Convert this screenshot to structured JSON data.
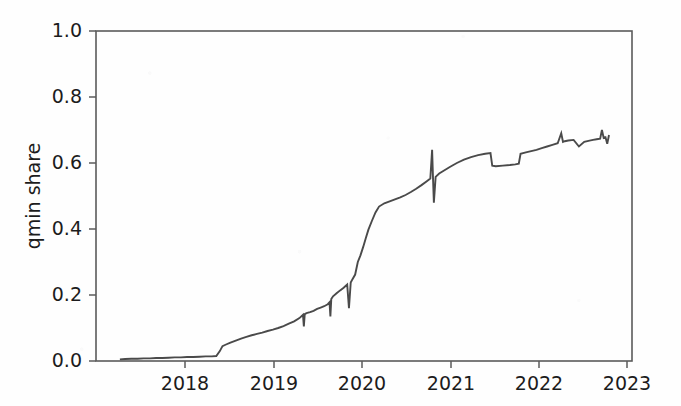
{
  "figure": {
    "background_color": "#fefefe",
    "line_color": "#4a4a4a",
    "axis_color": "#5b5b5b",
    "text_color": "#1c1c1c"
  },
  "axes": {
    "y_title": "qmin share",
    "x_title": "",
    "y_ticks": [
      "0.0",
      "0.2",
      "0.4",
      "0.6",
      "0.8",
      "1.0"
    ],
    "x_ticks": [
      "2018",
      "2019",
      "2020",
      "2021",
      "2022",
      "2023"
    ]
  },
  "chart_data": {
    "type": "line",
    "title": "",
    "xlabel": "",
    "ylabel": "qmin share",
    "xlim": [
      2017.0,
      2023.06
    ],
    "ylim": [
      0.0,
      1.0
    ],
    "grid": false,
    "legend": null,
    "x_tick_values": [
      2018,
      2019,
      2020,
      2021,
      2022,
      2023
    ],
    "x_tick_labels": [
      "2018",
      "2019",
      "2020",
      "2021",
      "2022",
      "2023"
    ],
    "y_tick_values": [
      0.0,
      0.2,
      0.4,
      0.6,
      0.8,
      1.0
    ],
    "y_tick_labels": [
      "0.0",
      "0.2",
      "0.4",
      "0.6",
      "0.8",
      "1.0"
    ],
    "series": [
      {
        "name": "qmin share",
        "color": "#4a4a4a",
        "x": [
          2017.27,
          2017.33,
          2017.4,
          2017.47,
          2017.54,
          2017.61,
          2017.68,
          2017.75,
          2017.82,
          2017.89,
          2017.96,
          2018.03,
          2018.1,
          2018.17,
          2018.24,
          2018.31,
          2018.36,
          2018.4,
          2018.43,
          2018.47,
          2018.52,
          2018.58,
          2018.64,
          2018.7,
          2018.76,
          2018.82,
          2018.88,
          2018.94,
          2019.0,
          2019.06,
          2019.12,
          2019.18,
          2019.24,
          2019.3,
          2019.34,
          2019.35,
          2019.36,
          2019.38,
          2019.42,
          2019.46,
          2019.5,
          2019.54,
          2019.58,
          2019.62,
          2019.64,
          2019.65,
          2019.66,
          2019.68,
          2019.72,
          2019.76,
          2019.8,
          2019.84,
          2019.86,
          2019.88,
          2019.9,
          2019.93,
          2019.96,
          2019.99,
          2020.02,
          2020.05,
          2020.08,
          2020.12,
          2020.16,
          2020.2,
          2020.26,
          2020.32,
          2020.38,
          2020.44,
          2020.5,
          2020.56,
          2020.62,
          2020.68,
          2020.74,
          2020.78,
          2020.8,
          2020.81,
          2020.82,
          2020.84,
          2020.88,
          2020.94,
          2021.0,
          2021.08,
          2021.16,
          2021.24,
          2021.32,
          2021.4,
          2021.46,
          2021.48,
          2021.52,
          2021.6,
          2021.68,
          2021.74,
          2021.78,
          2021.8,
          2021.86,
          2021.92,
          2021.98,
          2022.04,
          2022.1,
          2022.16,
          2022.22,
          2022.26,
          2022.28,
          2022.3,
          2022.34,
          2022.4,
          2022.46,
          2022.52,
          2022.58,
          2022.62,
          2022.66,
          2022.7,
          2022.72,
          2022.74,
          2022.76,
          2022.78,
          2022.8
        ],
        "y": [
          0.005,
          0.006,
          0.007,
          0.007,
          0.008,
          0.008,
          0.009,
          0.009,
          0.01,
          0.011,
          0.011,
          0.012,
          0.012,
          0.013,
          0.014,
          0.014,
          0.015,
          0.03,
          0.045,
          0.05,
          0.056,
          0.062,
          0.068,
          0.073,
          0.078,
          0.082,
          0.086,
          0.091,
          0.095,
          0.1,
          0.106,
          0.113,
          0.12,
          0.13,
          0.14,
          0.105,
          0.142,
          0.145,
          0.148,
          0.152,
          0.158,
          0.162,
          0.166,
          0.172,
          0.178,
          0.135,
          0.188,
          0.196,
          0.205,
          0.214,
          0.222,
          0.232,
          0.16,
          0.238,
          0.248,
          0.262,
          0.3,
          0.32,
          0.345,
          0.372,
          0.398,
          0.425,
          0.45,
          0.468,
          0.478,
          0.484,
          0.49,
          0.496,
          0.503,
          0.512,
          0.522,
          0.533,
          0.545,
          0.553,
          0.64,
          0.556,
          0.48,
          0.558,
          0.568,
          0.578,
          0.588,
          0.6,
          0.61,
          0.618,
          0.624,
          0.628,
          0.63,
          0.592,
          0.59,
          0.592,
          0.594,
          0.596,
          0.598,
          0.628,
          0.632,
          0.636,
          0.64,
          0.645,
          0.65,
          0.655,
          0.66,
          0.69,
          0.664,
          0.666,
          0.668,
          0.67,
          0.65,
          0.664,
          0.668,
          0.67,
          0.672,
          0.674,
          0.7,
          0.676,
          0.678,
          0.658,
          0.685
        ]
      }
    ]
  }
}
